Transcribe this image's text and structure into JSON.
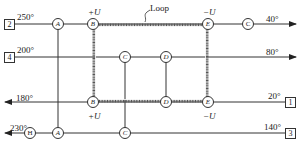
{
  "diagram": {
    "type": "heat-exchanger-network",
    "loop_label": "Loop",
    "streams": [
      {
        "id": "2",
        "temperature_in": "250°",
        "temperature_out": "40°",
        "direction": "right",
        "nodes": [
          "A",
          "B",
          "E",
          "C"
        ]
      },
      {
        "id": "4",
        "temperature_in": "200°",
        "temperature_out": "80°",
        "direction": "right",
        "nodes": [
          "C",
          "D"
        ]
      },
      {
        "id": "1",
        "temperature_in": "20°",
        "temperature_out": "180°",
        "direction": "left",
        "nodes": [
          "E",
          "D",
          "B"
        ]
      },
      {
        "id": "3",
        "temperature_in": "140°",
        "temperature_out": "230°",
        "direction": "left",
        "nodes": [
          "C",
          "A",
          "H"
        ]
      }
    ],
    "loop_annotations": {
      "top_b": "+U",
      "top_e": "−U",
      "bottom_b": "+U",
      "bottom_e": "−U"
    },
    "node_labels": {
      "A": "A",
      "B": "B",
      "C": "C",
      "D": "D",
      "E": "E",
      "H": "H"
    }
  }
}
